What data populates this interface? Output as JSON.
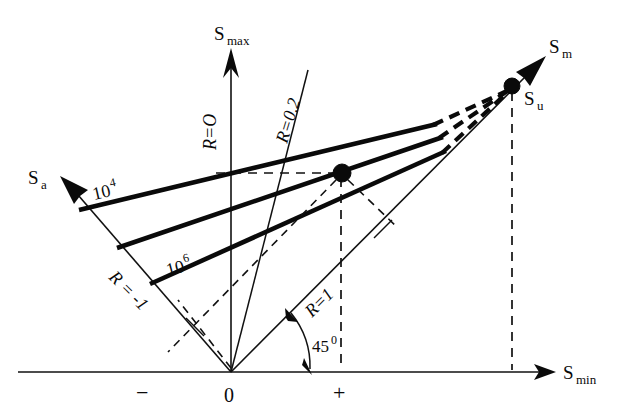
{
  "figure": {
    "type": "haigh-fatigue-diagram",
    "title": "",
    "background_color": "#ffffff",
    "line_color": "#0a0a0a"
  },
  "axes": {
    "vertical": {
      "name": "s-max-axis",
      "label": "S",
      "subscript": "max",
      "x": 231,
      "y_top": 48,
      "y_bottom": 372
    },
    "horizontal": {
      "name": "s-min-axis",
      "label": "S",
      "subscript": "min",
      "x_left": 18,
      "x_right": 552,
      "y": 372
    },
    "alternating": {
      "name": "s-a-axis",
      "label": "S",
      "subscript": "a",
      "angle_deg": 135,
      "tip_x": 60,
      "tip_y": 176
    },
    "mean": {
      "name": "s-m-axis",
      "label": "S",
      "subscript": "m",
      "angle_deg": 45,
      "tip_x": 545,
      "tip_y": 55
    }
  },
  "origin": {
    "label": "0",
    "x": 231,
    "y": 372
  },
  "sign_labels": {
    "negative": "−",
    "positive": "+"
  },
  "r_lines": [
    {
      "name": "r-zero",
      "label": "R=O",
      "value": "0",
      "label_x": 216,
      "label_y": 148,
      "rotation": -90
    },
    {
      "name": "r-point-two",
      "label": "R=0.2",
      "value": "0.2",
      "label_x": 287,
      "label_y": 140,
      "rotation": -72
    },
    {
      "name": "r-minus-one",
      "label": "R = -1",
      "value": "-1",
      "label_x": 120,
      "label_y": 312,
      "rotation": 45
    },
    {
      "name": "r-one",
      "label": "R=1",
      "value": "1",
      "label_x": 318,
      "label_y": 310,
      "rotation": -45
    }
  ],
  "life_curves": [
    {
      "name": "curve-10e4",
      "label": "10",
      "exponent": "4",
      "label_x": 97,
      "label_y": 196
    },
    {
      "name": "curve-10e6",
      "label": "10",
      "exponent": "6",
      "label_x": 172,
      "label_y": 272
    },
    {
      "name": "curve-10e8",
      "label": "",
      "exponent": "",
      "label_x": 0,
      "label_y": 0
    }
  ],
  "points": [
    {
      "name": "ultimate-strength-point",
      "label": "S",
      "subscript": "u",
      "x": 512,
      "y": 86,
      "label_x": 524,
      "label_y": 103
    },
    {
      "name": "operating-point",
      "label": "",
      "subscript": "",
      "x": 342,
      "y": 173,
      "label_x": 0,
      "label_y": 0
    }
  ],
  "annotations": [
    {
      "name": "angle-45-label",
      "text": "45",
      "superscript": "0",
      "x": 287,
      "y": 352
    }
  ]
}
